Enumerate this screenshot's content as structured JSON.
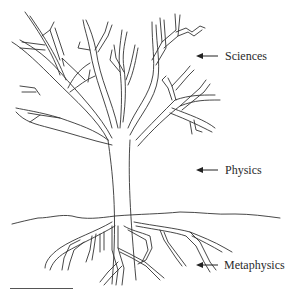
{
  "figure": {
    "type": "tree-of-knowledge-diagram",
    "labels": [
      {
        "id": "sciences",
        "text": "Sciences",
        "level": "branches"
      },
      {
        "id": "physics",
        "text": "Physics",
        "level": "trunk"
      },
      {
        "id": "metaphysics",
        "text": "Metaphysics",
        "level": "roots"
      }
    ],
    "arrow_icon": "left-arrow-icon",
    "colors": {
      "line": "#333333",
      "background": "#ffffff"
    }
  }
}
